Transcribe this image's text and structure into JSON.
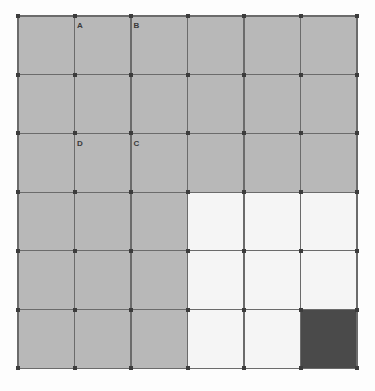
{
  "figure": {
    "kind": "shaded-grid-diagram",
    "background_color": "#fdfdfd",
    "width": 375,
    "height": 391
  },
  "grid": {
    "columns": 6,
    "rows": 6,
    "origin_x": 18,
    "origin_y": 16,
    "cell_width": 56.5,
    "cell_height": 58.7,
    "line_color": "#6b6b6b",
    "line_width": 1.1,
    "vertex_color": "#3c3c3c",
    "vertex_size": 4,
    "column_edges_x": [
      18,
      74.5,
      131,
      187.5,
      244,
      300.5,
      357
    ],
    "row_edges_y": [
      16,
      74.7,
      133.4,
      192.1,
      250.8,
      309.5,
      368.2
    ]
  },
  "palette": {
    "gray": "#b8b8b8",
    "white": "#f5f5f5",
    "dark": "#4a4a4a"
  },
  "cells": [
    [
      "gray",
      "gray",
      "gray",
      "gray",
      "gray",
      "gray"
    ],
    [
      "gray",
      "gray",
      "gray",
      "gray",
      "gray",
      "gray"
    ],
    [
      "gray",
      "gray",
      "gray",
      "gray",
      "gray",
      "gray"
    ],
    [
      "gray",
      "gray",
      "gray",
      "white",
      "white",
      "white"
    ],
    [
      "gray",
      "gray",
      "gray",
      "white",
      "white",
      "white"
    ],
    [
      "gray",
      "gray",
      "gray",
      "white",
      "white",
      "dark"
    ]
  ],
  "labels": [
    {
      "text": "A",
      "col": 1,
      "row": 1,
      "x": 77,
      "y": 22
    },
    {
      "text": "B",
      "col": 2,
      "row": 1,
      "x": 133.5,
      "y": 22
    },
    {
      "text": "D",
      "col": 1,
      "row": 3,
      "x": 77,
      "y": 139.5
    },
    {
      "text": "C",
      "col": 2,
      "row": 3,
      "x": 133.5,
      "y": 139.5
    }
  ]
}
